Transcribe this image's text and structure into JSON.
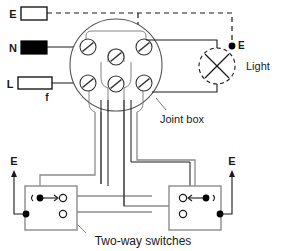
{
  "diagram": {
    "title_caption": "Two-way switches",
    "joint_box_label": "Joint box",
    "light_label": "Light",
    "supply": {
      "earth_label": "E",
      "neutral_label": "N",
      "live_label": "L",
      "fuse_label": "f"
    },
    "light": {
      "earth_terminal_label": "E",
      "symbol": "lamp-cross-circle"
    },
    "switch_left": {
      "earth_label": "E",
      "name": "two-way-switch-left"
    },
    "switch_right": {
      "earth_label": "E",
      "name": "two-way-switch-right"
    },
    "colors": {
      "wire": "#1a1a1a",
      "wire_grey": "#8c8c8c",
      "box_outline": "#8c8c8c",
      "terminal": "#1a1a1a",
      "neutral_block_fill": "#000000",
      "live_block_fill": "#ffffff",
      "earth_block_fill": "#ffffff",
      "background": "#ffffff",
      "text": "#1a1a1a"
    },
    "terminal_count": 6
  }
}
